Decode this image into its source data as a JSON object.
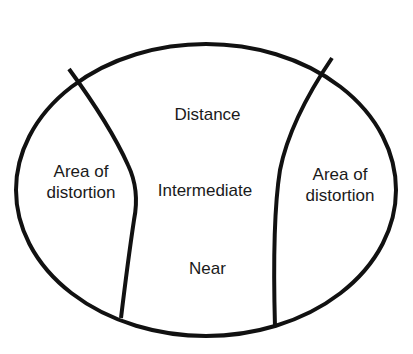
{
  "diagram": {
    "type": "progressive-lens-zones",
    "zones": {
      "distance": "Distance",
      "intermediate": "Intermediate",
      "near": "Near",
      "left_distortion_line1": "Area of",
      "left_distortion_line2": "distortion",
      "right_distortion_line1": "Area of",
      "right_distortion_line2": "distortion"
    },
    "colors": {
      "stroke": "#111111",
      "text": "#1a1a1a",
      "background": "#ffffff"
    }
  }
}
